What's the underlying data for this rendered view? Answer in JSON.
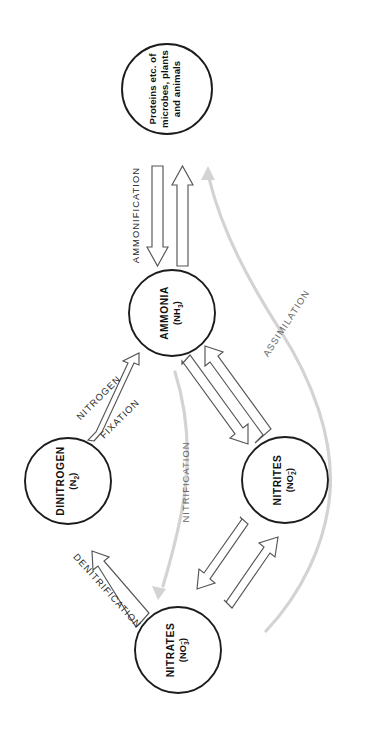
{
  "diagram": {
    "background_color": "#ffffff",
    "outline_color": "#1c1c1c",
    "arrow_stroke_color": "#555555",
    "gray_arrow_color": "#d3d3d3",
    "text_orientation": "rotated-90-counterclockwise",
    "nodes": [
      {
        "id": "proteins",
        "name": "proteins-node",
        "line1": "Proteins etc. of",
        "line2": "microbes, plants",
        "line3": "and animals",
        "formula": "",
        "cx": 167,
        "cy": 89,
        "r": 45
      },
      {
        "id": "ammonia",
        "name": "ammonia-node",
        "line1": "AMMONIA",
        "formula_open": "(NH",
        "formula_sub": "3",
        "formula_close": ")",
        "cx": 172,
        "cy": 313,
        "r": 43
      },
      {
        "id": "dinitrogen",
        "name": "dinitrogen-node",
        "line1": "DINITROGEN",
        "formula_open": "(N",
        "formula_sub": "2",
        "formula_close": ")",
        "cx": 68,
        "cy": 481,
        "r": 43
      },
      {
        "id": "nitrites",
        "name": "nitrites-node",
        "line1": "NITRITES",
        "formula_open": "(NO",
        "formula_sub": "2",
        "formula_sup": "–",
        "formula_close": ")",
        "cx": 285,
        "cy": 480,
        "r": 43
      },
      {
        "id": "nitrates",
        "name": "nitrates-node",
        "line1": "NITRATES",
        "formula_open": "(NO",
        "formula_sub": "3",
        "formula_sup": "–",
        "formula_close": ")",
        "cx": 178,
        "cy": 650,
        "r": 43
      }
    ],
    "processes": [
      {
        "id": "ammonification",
        "label": "AMMONIFICATION",
        "style": "black-block-arrows",
        "from": "proteins",
        "to": "ammonia",
        "direction": "bidirectional"
      },
      {
        "id": "assimilation",
        "label": "ASSIMILATION",
        "style": "gray-curve",
        "from": "nitrates",
        "to": "proteins",
        "direction": "up"
      },
      {
        "id": "nitrogen-fixation",
        "label_line1": "NITROGEN",
        "label_line2": "FIXATION",
        "style": "black-block-arrow",
        "from": "dinitrogen",
        "to": "ammonia",
        "direction": "up-right"
      },
      {
        "id": "nitrification",
        "label": "NITRIFICATION",
        "style": "gray-curve",
        "from": "ammonia",
        "to": "nitrates",
        "direction": "down"
      },
      {
        "id": "ammonia-nitrites",
        "label": "",
        "style": "black-block-arrows",
        "from": "ammonia",
        "to": "nitrites",
        "direction": "bidirectional"
      },
      {
        "id": "nitrites-nitrates",
        "label": "",
        "style": "black-block-arrows",
        "from": "nitrites",
        "to": "nitrates",
        "direction": "bidirectional"
      },
      {
        "id": "denitrification",
        "label": "DENITRIFICATION",
        "style": "black-block-arrow",
        "from": "nitrates",
        "to": "dinitrogen",
        "direction": "up-left"
      }
    ]
  }
}
